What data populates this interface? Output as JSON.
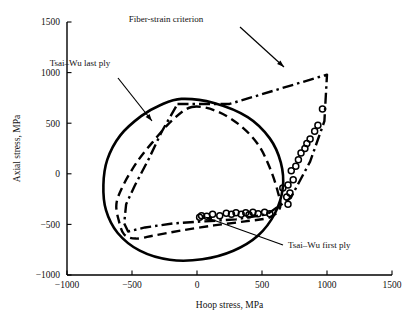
{
  "chart_data": {
    "type": "line",
    "title": "",
    "xlabel": "Hoop stress, MPa",
    "ylabel": "Axial stress, MPa",
    "xlim": [
      -1000,
      1500
    ],
    "ylim": [
      -1000,
      1500
    ],
    "xticks": [
      -1000,
      -500,
      0,
      500,
      1000,
      1500
    ],
    "xtick_labels": [
      "−1000",
      "−500",
      "0",
      "500",
      "1000",
      "1500"
    ],
    "yticks": [
      -1000,
      -500,
      0,
      500,
      1000,
      1500
    ],
    "ytick_labels": [
      "−1000",
      "−500",
      "0",
      "500",
      "1000",
      "1500"
    ],
    "grid": false,
    "legend": "none",
    "series": [
      {
        "name": "Tsai–Wu last ply",
        "style": "solid",
        "closed": true,
        "points": [
          [
            -120,
            740
          ],
          [
            130,
            700
          ],
          [
            390,
            560
          ],
          [
            560,
            350
          ],
          [
            645,
            110
          ],
          [
            660,
            -140
          ],
          [
            600,
            -390
          ],
          [
            470,
            -610
          ],
          [
            280,
            -760
          ],
          [
            40,
            -845
          ],
          [
            -210,
            -850
          ],
          [
            -440,
            -760
          ],
          [
            -610,
            -585
          ],
          [
            -700,
            -360
          ],
          [
            -720,
            -110
          ],
          [
            -690,
            140
          ],
          [
            -590,
            380
          ],
          [
            -430,
            570
          ],
          [
            -280,
            680
          ],
          [
            -120,
            740
          ]
        ]
      },
      {
        "name": "Tsai–Wu first ply",
        "style": "dashed",
        "closed": true,
        "points": [
          [
            -40,
            660
          ],
          [
            150,
            620
          ],
          [
            330,
            480
          ],
          [
            470,
            290
          ],
          [
            560,
            60
          ],
          [
            620,
            -170
          ],
          [
            640,
            -330
          ],
          [
            560,
            -430
          ],
          [
            370,
            -470
          ],
          [
            130,
            -510
          ],
          [
            -120,
            -560
          ],
          [
            -330,
            -610
          ],
          [
            -470,
            -640
          ],
          [
            -560,
            -600
          ],
          [
            -600,
            -470
          ],
          [
            -620,
            -300
          ],
          [
            -570,
            -120
          ],
          [
            -460,
            120
          ],
          [
            -330,
            330
          ],
          [
            -190,
            530
          ],
          [
            -40,
            660
          ]
        ]
      },
      {
        "name": "Fiber-strain criterion",
        "style": "dashdot",
        "closed": true,
        "points": [
          [
            -150,
            690
          ],
          [
            250,
            690
          ],
          [
            1000,
            980
          ],
          [
            980,
            520
          ],
          [
            870,
            120
          ],
          [
            720,
            -240
          ],
          [
            540,
            -400
          ],
          [
            300,
            -450
          ],
          [
            60,
            -470
          ],
          [
            -180,
            -490
          ],
          [
            -400,
            -530
          ],
          [
            -530,
            -570
          ],
          [
            -560,
            -490
          ],
          [
            -545,
            -300
          ],
          [
            -480,
            -120
          ],
          [
            -370,
            150
          ],
          [
            -270,
            420
          ],
          [
            -150,
            690
          ]
        ]
      }
    ],
    "scatter": {
      "name": "experimental-data",
      "marker": "open-circle",
      "points": [
        [
          20,
          -430
        ],
        [
          35,
          -415
        ],
        [
          75,
          -420
        ],
        [
          120,
          -400
        ],
        [
          175,
          -415
        ],
        [
          225,
          -390
        ],
        [
          265,
          -400
        ],
        [
          300,
          -385
        ],
        [
          340,
          -400
        ],
        [
          375,
          -385
        ],
        [
          400,
          -405
        ],
        [
          430,
          -380
        ],
        [
          470,
          -395
        ],
        [
          520,
          -380
        ],
        [
          560,
          -395
        ],
        [
          700,
          -300
        ],
        [
          690,
          -230
        ],
        [
          715,
          -190
        ],
        [
          660,
          -140
        ],
        [
          700,
          -110
        ],
        [
          740,
          -60
        ],
        [
          725,
          30
        ],
        [
          760,
          75
        ],
        [
          780,
          140
        ],
        [
          800,
          205
        ],
        [
          830,
          250
        ],
        [
          845,
          300
        ],
        [
          870,
          345
        ],
        [
          905,
          420
        ],
        [
          930,
          480
        ],
        [
          965,
          640
        ]
      ]
    },
    "annotations": [
      {
        "id": "tsai-wu-last-ply",
        "text": "Tsai–Wu last ply",
        "text_xy": [
          80,
          66
        ],
        "arrow_from": [
          118,
          78
        ],
        "arrow_to": [
          152,
          121
        ]
      },
      {
        "id": "fiber-strain-criterion",
        "text": "Fiber-strain criterion",
        "text_xy": [
          166,
          22
        ],
        "arrow_from": [
          240,
          27
        ],
        "arrow_to": [
          284,
          67
        ]
      },
      {
        "id": "tsai-wu-first-ply",
        "text": "Tsai–Wu first ply",
        "text_xy": [
          288,
          248
        ],
        "arrow_from": [
          283,
          245
        ],
        "arrow_to": [
          205,
          217
        ]
      }
    ]
  },
  "figure": {
    "background_color": "#ffffff",
    "line_color": "#000000",
    "plot_area": {
      "left": 67,
      "right": 392,
      "top": 22,
      "bottom": 275
    }
  }
}
